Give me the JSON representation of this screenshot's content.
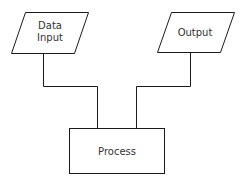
{
  "diagram": {
    "type": "flowchart",
    "nodes": [
      {
        "id": "data-input",
        "shape": "parallelogram",
        "lines": [
          "Data",
          "Input"
        ]
      },
      {
        "id": "output",
        "shape": "parallelogram",
        "label": "Output"
      },
      {
        "id": "process",
        "shape": "rectangle",
        "label": "Process"
      }
    ],
    "edges": [
      {
        "from": "data-input",
        "to": "process"
      },
      {
        "from": "output",
        "to": "process"
      }
    ],
    "colors": {
      "stroke": "#1a1a1a",
      "fill": "#ffffff",
      "text": "#333333"
    }
  }
}
